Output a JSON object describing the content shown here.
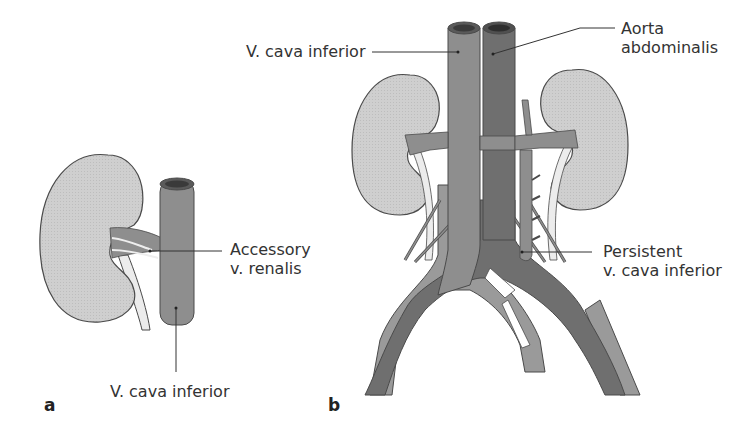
{
  "figure": {
    "panels": [
      {
        "id": "a",
        "label": "a",
        "annotations": {
          "accessory_renal_line1": "Accessory",
          "accessory_renal_line2": "v. renalis",
          "ivc": "V. cava inferior"
        }
      },
      {
        "id": "b",
        "label": "b",
        "annotations": {
          "ivc": "V. cava inferior",
          "aorta_line1": "Aorta",
          "aorta_line2": "abdominalis",
          "persistent_line1": "Persistent",
          "persistent_line2": "v. cava inferior"
        }
      }
    ],
    "colors": {
      "kidney": "#cfcfcf",
      "vein": "#8e8e8e",
      "artery": "#6f6f6f",
      "ureter": "#ececec",
      "outline": "#4a4a4a",
      "leader": "#333333"
    }
  }
}
